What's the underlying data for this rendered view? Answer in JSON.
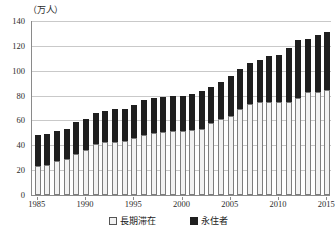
{
  "chart_data": {
    "type": "bar",
    "stacked": true,
    "title": "",
    "subtitle": "",
    "unit_label": "（万人）",
    "xlabel": "",
    "ylabel": "",
    "ylim": [
      0,
      140
    ],
    "ytick_step": 20,
    "yticks": [
      0,
      20,
      40,
      60,
      80,
      100,
      120,
      140
    ],
    "grid": true,
    "legend_position": "bottom",
    "xtick_labels": [
      "1985",
      "1990",
      "1995",
      "2000",
      "2005",
      "2010",
      "2015"
    ],
    "categories": [
      "1985",
      "1986",
      "1987",
      "1988",
      "1989",
      "1990",
      "1991",
      "1992",
      "1993",
      "1994",
      "1995",
      "1996",
      "1997",
      "1998",
      "1999",
      "2000",
      "2001",
      "2002",
      "2003",
      "2004",
      "2005",
      "2006",
      "2007",
      "2008",
      "2009",
      "2010",
      "2011",
      "2012",
      "2013",
      "2014",
      "2015"
    ],
    "series": [
      {
        "name": "長期滞在",
        "color": "#f2f2f2",
        "values": [
          23,
          24,
          27,
          29,
          33,
          36,
          41,
          42.5,
          43,
          43.5,
          45.5,
          48.5,
          50,
          50.5,
          51.5,
          51.5,
          52,
          53.5,
          58,
          61,
          63.5,
          69.5,
          73.5,
          74.5,
          74.5,
          75,
          75,
          78,
          82.5,
          83,
          84.5
        ]
      },
      {
        "name": "永住者",
        "color": "#1f1f1f",
        "values": [
          25,
          25,
          24.5,
          24,
          25.5,
          25.5,
          25,
          25.5,
          26,
          25.5,
          27,
          28,
          28,
          28.5,
          28,
          28.5,
          29,
          30,
          29,
          30,
          32,
          31.5,
          32.5,
          34,
          37,
          38,
          43,
          46.5,
          43,
          46,
          46.5
        ]
      }
    ],
    "totals": [
      48,
      49,
      51.5,
      53,
      58.5,
      61.5,
      66,
      68,
      69,
      69,
      72.5,
      76.5,
      78,
      79,
      79.5,
      80,
      81,
      83.5,
      87,
      91,
      95.5,
      101,
      106,
      108.5,
      111.5,
      113,
      118,
      124.5,
      125.5,
      129,
      131
    ]
  },
  "legend": {
    "items": [
      {
        "label": "長期滞在",
        "swatch": "light-square-icon"
      },
      {
        "label": "永住者",
        "swatch": "dark-square-icon"
      }
    ]
  }
}
